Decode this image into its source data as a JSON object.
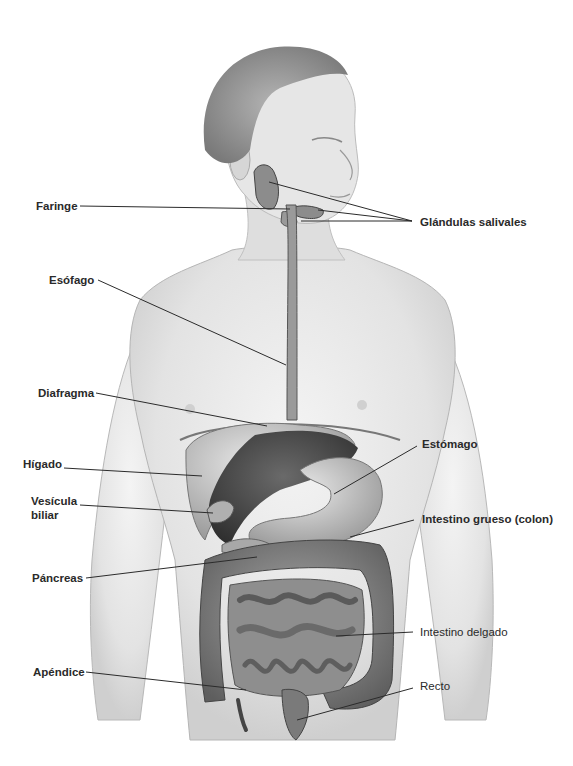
{
  "figure": {
    "background": "#ffffff",
    "line_color": "#2b2b2b",
    "text_color": "#2a2a2a"
  },
  "labels": {
    "faringe": "Faringe",
    "glandulas_salivales": "Glándulas salivales",
    "esofago": "Esófago",
    "diafragma": "Diafragma",
    "higado": "Hígado",
    "vesicula_1": "Vesícula",
    "vesicula_2": "biliar",
    "pancreas": "Páncreas",
    "estomago": "Estómago",
    "intestino_grueso": "Intestino grueso (colon)",
    "intestino_delgado": "Intestino delgado",
    "apendice": "Apéndice",
    "recto": "Recto"
  }
}
